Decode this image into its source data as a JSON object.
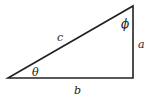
{
  "diagram": {
    "type": "right-triangle",
    "stroke_color": "#222222",
    "vertices": {
      "angle_theta_vertex": [
        8,
        78
      ],
      "right_angle_vertex": [
        133,
        78
      ],
      "angle_phi_vertex": [
        133,
        6
      ]
    },
    "labels": {
      "hypotenuse": "c",
      "vertical_side": "a",
      "horizontal_side": "b",
      "angle_bottom_left": "θ",
      "angle_top": "ϕ"
    }
  }
}
